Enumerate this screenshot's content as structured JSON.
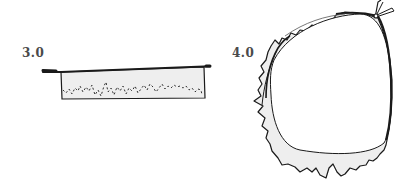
{
  "figures": [
    {
      "id": "stage-3",
      "label": "3.0",
      "subject": "shallow tray with rough fill"
    },
    {
      "id": "stage-4",
      "label": "4.0",
      "subject": "rolled ring with torn edge"
    }
  ],
  "colors": {
    "ink": "#1a1a1a",
    "fill": "#eeeeee",
    "label": "#4a4a4a",
    "background": "#ffffff"
  }
}
